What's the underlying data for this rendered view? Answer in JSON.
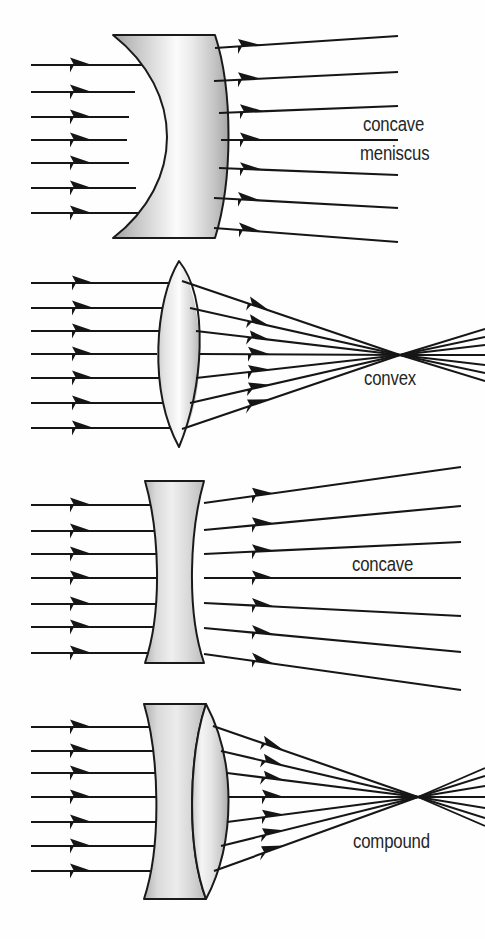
{
  "figure": {
    "background_color": "#fefefe",
    "ink_color": "#161616",
    "glass_light": "#ffffff",
    "glass_mid": "#d8d8d8",
    "glass_dark": "#a9a9a9",
    "width": 485,
    "height": 939
  },
  "panels": [
    {
      "id": "panel-concave-meniscus",
      "label_lines": [
        "concave",
        "meniscus"
      ],
      "label_full": "concave meniscus",
      "lens_type": "concave meniscus",
      "behavior": "diverging",
      "incoming_ray_count": 7,
      "outgoing_ray_count": 7,
      "focal_point": null
    },
    {
      "id": "panel-convex",
      "label_lines": [
        "convex"
      ],
      "label_full": "convex",
      "lens_type": "convex",
      "behavior": "converging",
      "incoming_ray_count": 7,
      "outgoing_ray_count": 7,
      "focal_point": {
        "x": 400,
        "y": 355
      }
    },
    {
      "id": "panel-concave",
      "label_lines": [
        "concave"
      ],
      "label_full": "concave",
      "lens_type": "concave",
      "behavior": "diverging",
      "incoming_ray_count": 7,
      "outgoing_ray_count": 7,
      "focal_point": null
    },
    {
      "id": "panel-compound",
      "label_lines": [
        "compound"
      ],
      "label_full": "compound",
      "lens_type": "compound",
      "behavior": "converging",
      "incoming_ray_count": 7,
      "outgoing_ray_count": 7,
      "focal_point": {
        "x": 418,
        "y": 797
      }
    }
  ],
  "labels": {
    "concave_meniscus_line1": "concave",
    "concave_meniscus_line2": "meniscus",
    "convex": "convex",
    "concave": "concave",
    "compound": "compound"
  }
}
